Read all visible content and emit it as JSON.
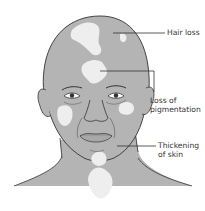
{
  "figure": {
    "colors": {
      "background": "#ffffff",
      "skin": "#b4b4b4",
      "depigmented_patch": "#eeeeee",
      "outline": "#333333",
      "leader_line": "#333333",
      "label_text": "#333333"
    },
    "annotations": [
      {
        "id": "hair-loss",
        "lines": [
          "Hair loss"
        ]
      },
      {
        "id": "loss-of-pigmentation",
        "lines": [
          "Loss of",
          "pigmentation"
        ]
      },
      {
        "id": "thickening-of-skin",
        "lines": [
          "Thickening",
          "of skin"
        ]
      }
    ]
  }
}
